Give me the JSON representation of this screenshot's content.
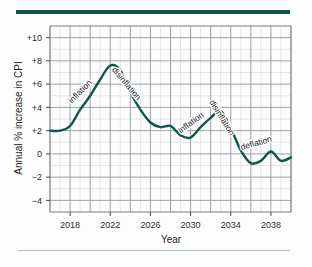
{
  "figure": {
    "accent_color": "#11564d",
    "grid_minor_color": "#d6d6d6",
    "grid_major_color": "#8e9a99",
    "series_color": "#11564d",
    "background": "#fdfdfd"
  },
  "chart_data": {
    "type": "line",
    "title": "",
    "xlabel": "Year",
    "ylabel": "Annual % increase in CPI",
    "xlim": [
      2016,
      2040
    ],
    "ylim": [
      -5,
      11
    ],
    "grid": true,
    "legend": "none",
    "xticks": [
      "2018",
      "2022",
      "2026",
      "2030",
      "2034",
      "2038"
    ],
    "xtick_values": [
      2018,
      2022,
      2026,
      2030,
      2034,
      2038
    ],
    "yticks": [
      "+10",
      "+8",
      "+6",
      "+4",
      "+2",
      "0",
      "−2",
      "−4"
    ],
    "ytick_values": [
      10,
      8,
      6,
      4,
      2,
      0,
      -2,
      -4
    ],
    "series": [
      {
        "name": "Annual % increase in CPI",
        "color": "#11564d",
        "x": [
          2016,
          2017,
          2018,
          2019,
          2020,
          2021,
          2022,
          2023,
          2024,
          2025,
          2026,
          2027,
          2028,
          2029,
          2030,
          2031,
          2032,
          2033,
          2034,
          2035,
          2036,
          2037,
          2038,
          2039,
          2040
        ],
        "values": [
          2.0,
          2.0,
          2.4,
          3.8,
          5.0,
          6.4,
          7.6,
          7.2,
          5.3,
          3.8,
          2.7,
          2.3,
          2.4,
          1.6,
          1.4,
          2.3,
          3.1,
          3.7,
          2.2,
          0.3,
          -0.8,
          -0.6,
          0.2,
          -0.6,
          -0.3
        ]
      }
    ],
    "annotations": [
      {
        "text": "inflation",
        "x": 2019.2,
        "y": 5.2,
        "rotation": -45
      },
      {
        "text": "disinflation",
        "x": 2023.4,
        "y": 5.9,
        "rotation": 50
      },
      {
        "text": "inflation",
        "x": 2030.2,
        "y": 2.5,
        "rotation": -36
      },
      {
        "text": "disinflation",
        "x": 2032.9,
        "y": 3.0,
        "rotation": 58
      },
      {
        "text": "deflation",
        "x": 2036.6,
        "y": 0.7,
        "rotation": -16
      }
    ]
  }
}
